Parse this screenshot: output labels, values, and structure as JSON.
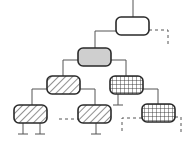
{
  "diagram": {
    "type": "tree",
    "colors": {
      "stroke": "#2a2a2a",
      "line": "#555555",
      "dashed": "#555555",
      "gray_fill": "#cfcfcf",
      "white_fill": "#ffffff"
    },
    "nodes": [
      {
        "id": "root",
        "pattern": "empty",
        "x": 116,
        "y": 17,
        "w": 33,
        "h": 18
      },
      {
        "id": "gray",
        "pattern": "gray",
        "x": 78,
        "y": 48,
        "w": 33,
        "h": 18
      },
      {
        "id": "hatch-mid-left",
        "pattern": "diagonal",
        "x": 47,
        "y": 76,
        "w": 33,
        "h": 18
      },
      {
        "id": "grid-mid-right",
        "pattern": "grid",
        "x": 110,
        "y": 76,
        "w": 33,
        "h": 18
      },
      {
        "id": "hatch-bottom-left",
        "pattern": "diagonal",
        "x": 14,
        "y": 105,
        "w": 33,
        "h": 18
      },
      {
        "id": "hatch-bottom-mid",
        "pattern": "diagonal",
        "x": 78,
        "y": 105,
        "w": 33,
        "h": 18
      },
      {
        "id": "grid-bottom-right",
        "pattern": "grid",
        "x": 142,
        "y": 104,
        "w": 33,
        "h": 18
      }
    ],
    "solid_edges": [
      {
        "from": "top",
        "to": "root",
        "points": "133,0 133,17"
      },
      {
        "from": "root",
        "to": "gray",
        "points": "116,31 95,31 95,48"
      },
      {
        "from": "gray",
        "to": "hatch-mid-left",
        "points": "78,60 63,60 63,76"
      },
      {
        "from": "gray",
        "to": "grid-mid-right",
        "points": "111,60 126,60 126,76"
      },
      {
        "from": "hatch-mid-left",
        "to": "hatch-bottom-left",
        "points": "47,89 32,89 32,105"
      },
      {
        "from": "hatch-mid-left",
        "to": "hatch-bottom-mid",
        "points": "80,89 95,89 95,105"
      },
      {
        "from": "grid-mid-right",
        "to": "grid-bottom-right",
        "points": "143,89 158,89 158,104"
      }
    ],
    "dashed_edges": [
      {
        "from": "root",
        "points": "149,30 168,30 168,46"
      },
      {
        "to": "hatch-bottom-mid",
        "points": "59,119 78,119"
      },
      {
        "to": "grid-bottom-right",
        "points": "142,118 122,118 122,134"
      },
      {
        "from": "grid-bottom-right",
        "points": "175,117 181,117 181,134"
      }
    ],
    "ground_terminals": [
      {
        "node": "grid-mid-right",
        "x": 118,
        "y1": 94,
        "y2": 105
      },
      {
        "node": "hatch-bottom-left",
        "x": 23,
        "y1": 123,
        "y2": 134
      },
      {
        "node": "hatch-bottom-left",
        "x": 40,
        "y1": 123,
        "y2": 134
      },
      {
        "node": "hatch-bottom-mid",
        "x": 96,
        "y1": 123,
        "y2": 134
      }
    ]
  }
}
